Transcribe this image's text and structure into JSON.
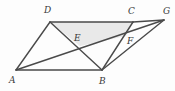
{
  "figure": {
    "canvas": {
      "width": 175,
      "height": 91
    },
    "background_color": "#fdfdfd",
    "stroke_color": "#4a4a4a",
    "shaded_fill_color": "#e9e9e9",
    "label_color": "#3a3a3a",
    "points": [
      {
        "id": "A",
        "label": "A",
        "x": 16,
        "y": 70,
        "label_x": 9,
        "label_y": 83
      },
      {
        "id": "B",
        "label": "B",
        "x": 102,
        "y": 70,
        "label_x": 99,
        "label_y": 84
      },
      {
        "id": "C",
        "label": "C",
        "x": 133,
        "y": 22,
        "label_x": 128,
        "label_y": 14
      },
      {
        "id": "D",
        "label": "D",
        "x": 50,
        "y": 22,
        "label_x": 44,
        "label_y": 13
      },
      {
        "id": "E",
        "label": "E",
        "x": 80,
        "y": 46,
        "label_x": 74,
        "label_y": 41
      },
      {
        "id": "F",
        "label": "F",
        "x": 126,
        "y": 36,
        "label_x": 127,
        "label_y": 44
      },
      {
        "id": "G",
        "label": "G",
        "x": 164,
        "y": 20,
        "label_x": 163,
        "label_y": 14
      }
    ],
    "segments": [
      {
        "id": "AD",
        "from": "A",
        "to": "D"
      },
      {
        "id": "DC",
        "from": "D",
        "to": "C"
      },
      {
        "id": "CG",
        "from": "C",
        "to": "G"
      },
      {
        "id": "AB",
        "from": "A",
        "to": "B"
      },
      {
        "id": "BC",
        "from": "B",
        "to": "C"
      },
      {
        "id": "BG",
        "from": "B",
        "to": "G"
      },
      {
        "id": "AG",
        "from": "A",
        "to": "G"
      },
      {
        "id": "DB",
        "from": "D",
        "to": "B"
      }
    ],
    "shaded_region": {
      "id": "DCFE",
      "vertices": [
        "D",
        "C",
        "F",
        "E"
      ]
    }
  }
}
